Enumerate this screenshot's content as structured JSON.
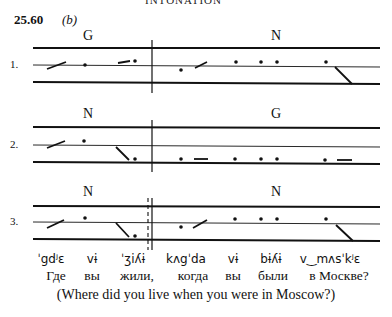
{
  "header": {
    "clipped_heading": "INTONATION",
    "example_number": "25.60",
    "example_part": "(b)"
  },
  "staves": [
    {
      "label": "1.",
      "left_tag": "G",
      "right_tag": "N",
      "divider": "solid"
    },
    {
      "label": "2.",
      "left_tag": "N",
      "right_tag": "G",
      "divider": "solid"
    },
    {
      "label": "3.",
      "left_tag": "N",
      "right_tag": "N",
      "divider": "dashed-and-solid"
    }
  ],
  "transcription": {
    "phonetic": [
      "ˈgdʲɛ",
      "vɨ",
      "ˈʒiʎɨ",
      "kʌgˈda",
      "vɨ",
      "bɨʎɨ",
      "v‿mʌsˈkʲɛ"
    ],
    "russian": [
      "Где",
      "вы",
      "жили,",
      "когда",
      "вы",
      "были",
      "в Москве?"
    ],
    "english": "(Where did you live when you were in Moscow?)"
  }
}
